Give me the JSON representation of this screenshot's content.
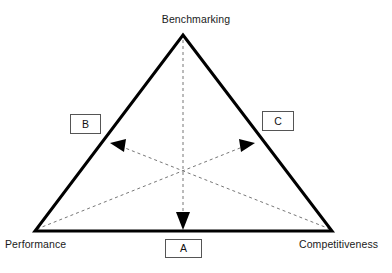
{
  "diagram": {
    "type": "triangle-relationship-diagram",
    "colors": {
      "triangle_stroke": "#000000",
      "dashed_stroke": "#666666",
      "arrow_fill": "#000000",
      "box_border": "#555555",
      "background": "#ffffff",
      "text": "#1a1a1a"
    },
    "geometry": {
      "apex": [
        183,
        35
      ],
      "bottom_left": [
        35,
        231
      ],
      "bottom_right": [
        332,
        231
      ],
      "centroid": [
        183,
        166
      ]
    }
  },
  "vertices": {
    "top": "Benchmarking",
    "bottom_left": "Performance",
    "bottom_right": "Competitiveness"
  },
  "tags": {
    "a": "A",
    "b": "B",
    "c": "C"
  },
  "arrows": [
    {
      "id": "arrow-a",
      "label": "A",
      "from": "Benchmarking",
      "to": "bottom-edge-midpoint",
      "style": "dashed",
      "head": "filled-triangle",
      "start": [
        183,
        35
      ],
      "end": [
        183,
        230
      ]
    },
    {
      "id": "arrow-b",
      "label": "B",
      "from": "Competitiveness",
      "to": "left-edge-midpoint",
      "style": "dashed",
      "head": "filled-triangle",
      "start": [
        332,
        231
      ],
      "end": [
        110,
        143
      ]
    },
    {
      "id": "arrow-c",
      "label": "C",
      "from": "Performance",
      "to": "right-edge-midpoint",
      "style": "dashed",
      "head": "filled-triangle",
      "start": [
        35,
        231
      ],
      "end": [
        255,
        143
      ]
    }
  ]
}
